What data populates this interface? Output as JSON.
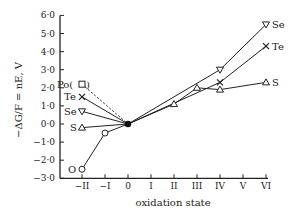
{
  "chart_data": {
    "type": "line",
    "title": "",
    "xlabel": "oxidation state",
    "ylabel": "−ΔG/F = nE, V",
    "x_categories": [
      "−II",
      "−I",
      "0",
      "I",
      "II",
      "III",
      "IV",
      "V",
      "VI"
    ],
    "x_values": [
      -2,
      -1,
      0,
      1,
      2,
      3,
      4,
      5,
      6
    ],
    "y_ticks": [
      "6·0",
      "5·0",
      "4·0",
      "3·0",
      "2·0",
      "1·0",
      "0·0",
      "−1·0",
      "−2·0",
      "−3·0"
    ],
    "ylim": [
      -3.0,
      6.0
    ],
    "grid": false,
    "legend_position": "inline labels at line ends",
    "series": [
      {
        "name": "O",
        "marker": "circle",
        "points": [
          [
            -2,
            -2.5
          ],
          [
            -1,
            -0.5
          ],
          [
            0,
            0.0
          ]
        ]
      },
      {
        "name": "S",
        "marker": "triangle-up",
        "points": [
          [
            -2,
            -0.2
          ],
          [
            0,
            0.0
          ],
          [
            2,
            1.1
          ],
          [
            3,
            2.0
          ],
          [
            4,
            1.9
          ],
          [
            6,
            2.3
          ]
        ]
      },
      {
        "name": "Se",
        "marker": "triangle-down",
        "points": [
          [
            -2,
            0.7
          ],
          [
            0,
            0.0
          ],
          [
            4,
            3.0
          ],
          [
            6,
            5.5
          ]
        ]
      },
      {
        "name": "Te",
        "marker": "cross",
        "points": [
          [
            -2,
            1.5
          ],
          [
            0,
            0.0
          ],
          [
            4,
            2.3
          ],
          [
            6,
            4.3
          ]
        ]
      },
      {
        "name": "Po",
        "marker": "square-parenthesized",
        "style": "dashed",
        "points": [
          [
            -2,
            2.2
          ],
          [
            0,
            0.0
          ]
        ]
      }
    ],
    "origin_point": {
      "x": 0,
      "y": 0.0,
      "marker": "filled-circle"
    }
  }
}
